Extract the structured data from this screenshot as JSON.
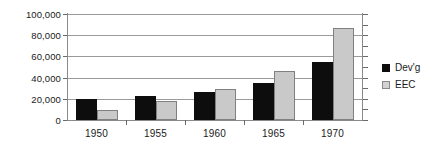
{
  "chart_data": {
    "type": "bar",
    "title": "",
    "subtitle": "",
    "xlabel": "",
    "ylabel": "",
    "categories": [
      "1950",
      "1955",
      "1960",
      "1965",
      "1970"
    ],
    "series": [
      {
        "name": "Dev'g",
        "color": "#0d0d0d",
        "values": [
          19500,
          23000,
          26500,
          35000,
          55000
        ]
      },
      {
        "name": "EEC",
        "color": "#c9c9c9",
        "values": [
          9000,
          18000,
          29000,
          46000,
          87000
        ]
      }
    ],
    "ylim": [
      0,
      100000
    ],
    "ytick_values": [
      0,
      20000,
      40000,
      60000,
      80000,
      100000
    ],
    "ytick_labels": [
      "0",
      "20,000",
      "40,000",
      "60,000",
      "80,000",
      "100,000"
    ],
    "grid": true,
    "legend_position": "right"
  },
  "legend": {
    "entries": [
      {
        "label": "Dev'g"
      },
      {
        "label": "EEC"
      }
    ]
  },
  "axes": {
    "y_labels": [
      "100,000",
      "80,000",
      "60,000",
      "40,000",
      "20,000",
      "0"
    ],
    "x_labels": [
      "1950",
      "1955",
      "1960",
      "1965",
      "1970"
    ]
  },
  "colors": {
    "series_devg": "#0d0d0d",
    "series_eec": "#c9c9c9",
    "gridline": "#9a9a9a",
    "axis": "#8a8a8a",
    "text": "#1a1a1a",
    "background": "#ffffff"
  }
}
